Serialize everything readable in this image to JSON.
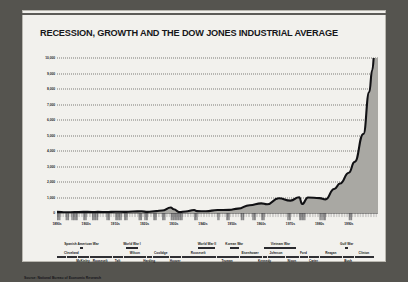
{
  "title": "RECESSION, GROWTH AND THE DOW JONES INDUSTRIAL AVERAGE",
  "source": "Source: National Bureau of Economic Research",
  "colors": {
    "frame": "#55544f",
    "card": "#f2f1ed",
    "line": "#111114",
    "fill": "#a9a8a3",
    "grid": "#7d7c78",
    "text": "#17171a"
  },
  "chart_data": {
    "type": "area",
    "title": "RECESSION, GROWTH AND THE DOW JONES INDUSTRIAL AVERAGE",
    "xlabel": "",
    "ylabel": "",
    "grid": true,
    "legend": "none",
    "ylim": [
      0,
      10000
    ],
    "xlim": [
      1890,
      2000
    ],
    "ytick_labels": [
      "10,000",
      "9,000",
      "8,000",
      "7,000",
      "6,000",
      "5,000",
      "4,000",
      "3,000",
      "2,000",
      "1,000",
      "0"
    ],
    "ytick_values": [
      10000,
      9000,
      8000,
      7000,
      6000,
      5000,
      4000,
      3000,
      2000,
      1000,
      0
    ],
    "xtick_labels": [
      "1890s",
      "1900s",
      "1910s",
      "1920s",
      "1930s",
      "1940s",
      "1950s",
      "1960s",
      "1970s",
      "1980s",
      "1990s"
    ],
    "xtick_values": [
      1890,
      1900,
      1910,
      1920,
      1930,
      1940,
      1950,
      1960,
      1970,
      1980,
      1990
    ],
    "series": [
      {
        "name": "Dow Jones Industrial Average",
        "x": [
          1890,
          1893,
          1896,
          1899,
          1902,
          1904,
          1907,
          1910,
          1913,
          1916,
          1919,
          1921,
          1924,
          1926,
          1929,
          1930,
          1932,
          1934,
          1937,
          1938,
          1941,
          1945,
          1949,
          1952,
          1956,
          1960,
          1962,
          1966,
          1970,
          1973,
          1974,
          1976,
          1980,
          1982,
          1985,
          1987,
          1990,
          1992,
          1995,
          1997,
          1998,
          1999,
          2000
        ],
        "y": [
          70,
          45,
          55,
          75,
          65,
          70,
          60,
          85,
          72,
          95,
          110,
          70,
          120,
          160,
          350,
          240,
          60,
          100,
          190,
          120,
          115,
          190,
          200,
          280,
          500,
          620,
          560,
          950,
          800,
          1020,
          580,
          1000,
          960,
          880,
          1550,
          1900,
          2600,
          3300,
          5100,
          7800,
          9200,
          10800,
          11200
        ]
      }
    ],
    "annotations": {
      "wars": [
        {
          "label": "Spanish American War",
          "start": 1898,
          "end": 1899
        },
        {
          "label": "World War I",
          "start": 1914,
          "end": 1918
        },
        {
          "label": "World War II",
          "start": 1939,
          "end": 1945
        },
        {
          "label": "Korean War",
          "start": 1950,
          "end": 1953
        },
        {
          "label": "Vietnam War",
          "start": 1962,
          "end": 1973
        },
        {
          "label": "Gulf War",
          "start": 1990,
          "end": 1991
        }
      ],
      "presidents": [
        {
          "name": "Cleveland",
          "start": 1893,
          "end": 1897,
          "row": "up"
        },
        {
          "name": "McKinley",
          "start": 1897,
          "end": 1901,
          "row": "dn"
        },
        {
          "name": "Roosevelt",
          "start": 1901,
          "end": 1909,
          "row": "dn"
        },
        {
          "name": "Taft",
          "start": 1909,
          "end": 1913,
          "row": "dn"
        },
        {
          "name": "Wilson",
          "start": 1913,
          "end": 1921,
          "row": "up"
        },
        {
          "name": "Harding",
          "start": 1921,
          "end": 1923,
          "row": "dn"
        },
        {
          "name": "Coolidge",
          "start": 1923,
          "end": 1929,
          "row": "up"
        },
        {
          "name": "Hoover",
          "start": 1929,
          "end": 1933,
          "row": "dn"
        },
        {
          "name": "Roosevelt",
          "start": 1933,
          "end": 1945,
          "row": "up"
        },
        {
          "name": "Truman",
          "start": 1945,
          "end": 1953,
          "row": "dn"
        },
        {
          "name": "Eisenhower",
          "start": 1953,
          "end": 1961,
          "row": "up"
        },
        {
          "name": "Kennedy",
          "start": 1961,
          "end": 1963,
          "row": "dn"
        },
        {
          "name": "Johnson",
          "start": 1963,
          "end": 1969,
          "row": "up"
        },
        {
          "name": "Nixon",
          "start": 1969,
          "end": 1974,
          "row": "dn"
        },
        {
          "name": "Ford",
          "start": 1974,
          "end": 1977,
          "row": "up"
        },
        {
          "name": "Carter",
          "start": 1977,
          "end": 1981,
          "row": "dn"
        },
        {
          "name": "Reagan",
          "start": 1981,
          "end": 1989,
          "row": "up"
        },
        {
          "name": "Bush",
          "start": 1989,
          "end": 1993,
          "row": "dn"
        },
        {
          "name": "Clinton",
          "start": 1993,
          "end": 2001,
          "row": "up"
        }
      ],
      "recession_bands": [
        [
          1890,
          1891
        ],
        [
          1893,
          1894
        ],
        [
          1895,
          1897
        ],
        [
          1899,
          1900
        ],
        [
          1902,
          1904
        ],
        [
          1907,
          1908
        ],
        [
          1910,
          1912
        ],
        [
          1913,
          1914
        ],
        [
          1918,
          1919
        ],
        [
          1920,
          1921
        ],
        [
          1923,
          1924
        ],
        [
          1926,
          1927
        ],
        [
          1929,
          1933
        ],
        [
          1937,
          1938
        ],
        [
          1945,
          1945
        ],
        [
          1948,
          1949
        ],
        [
          1953,
          1954
        ],
        [
          1957,
          1958
        ],
        [
          1960,
          1961
        ],
        [
          1969,
          1970
        ],
        [
          1973,
          1975
        ],
        [
          1980,
          1980
        ],
        [
          1981,
          1982
        ],
        [
          1990,
          1991
        ]
      ]
    }
  }
}
